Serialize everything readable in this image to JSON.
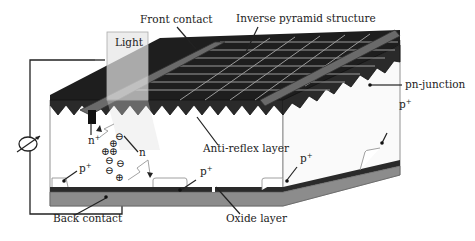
{
  "diagram": {
    "labels": {
      "front_contact": "Front contact",
      "inverse_pyramid": "Inverse pyramid structure",
      "light": "Light",
      "pn_junction": "pn-junction",
      "anti_reflex": "Anti-reflex layer",
      "back_contact": "Back contact",
      "oxide_layer": "Oxide layer",
      "n_plus": "n",
      "n_plus_sup": "+",
      "n": "n",
      "p_plus": "p",
      "p_plus_sup": "+"
    },
    "charges": {
      "positive": "⊕",
      "negative": "⊖"
    },
    "colors": {
      "surface_dark": "#1e1e1e",
      "surface_mid": "#3a3a3a",
      "grid_line": "#9a9a9a",
      "contact_bar": "#555555",
      "oxide": "#8c8c8c",
      "back_layer": "#2a2a2a",
      "light_box": "#e6e6e6",
      "wire": "#222222"
    }
  }
}
